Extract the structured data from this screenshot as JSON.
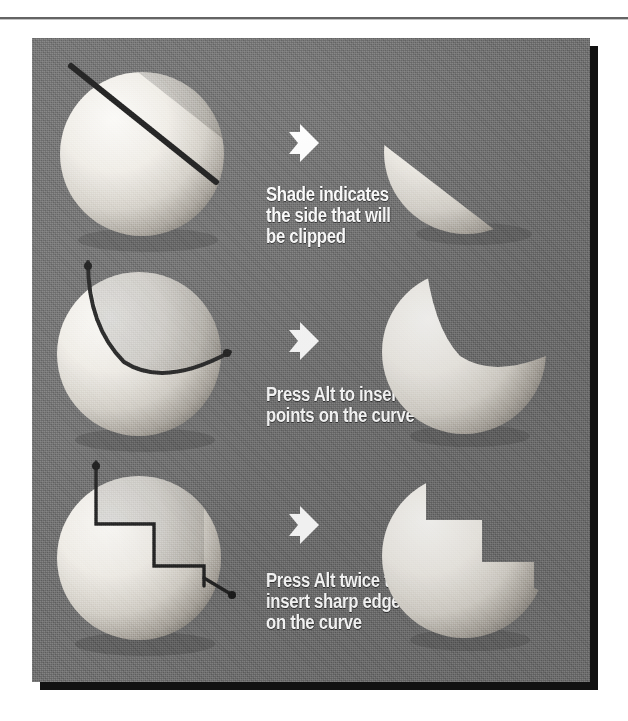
{
  "figure": {
    "background_color": "#6f6f6f",
    "panel_shadow_color": "#111111",
    "caption_color": "#ffffff",
    "sphere_light_color": "#f2f0eb",
    "sphere_shade_color": "#8d8a85",
    "stroke_color": "#1d1d1d",
    "arrow_icon": "right-arrow-icon"
  },
  "rows": [
    {
      "id": "row-straight-line",
      "caption": "Shade indicates\nthe side that will\nbe clipped",
      "arrow": "right-arrow-icon",
      "before_label": "sphere-with-straight-clip-line",
      "after_label": "sphere-clipped-by-straight-line"
    },
    {
      "id": "row-curve",
      "caption": "Press Alt to insert\npoints on the curve",
      "arrow": "right-arrow-icon",
      "before_label": "sphere-with-curved-clip-path",
      "after_label": "sphere-clipped-by-curve"
    },
    {
      "id": "row-sharp-edges",
      "caption": "Press Alt twice to\ninsert sharp edges\non the curve",
      "arrow": "right-arrow-icon",
      "before_label": "sphere-with-zigzag-clip-path",
      "after_label": "sphere-clipped-by-zigzag"
    }
  ]
}
